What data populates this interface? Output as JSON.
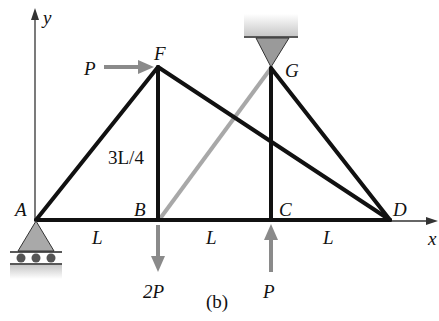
{
  "figure": {
    "caption": "(b)",
    "axes": {
      "x_label": "x",
      "y_label": "y"
    },
    "joints": {
      "A": {
        "label": "A"
      },
      "B": {
        "label": "B"
      },
      "C": {
        "label": "C"
      },
      "D": {
        "label": "D"
      },
      "F": {
        "label": "F"
      },
      "G": {
        "label": "G"
      }
    },
    "dimensions": {
      "AB": "L",
      "BC": "L",
      "CD": "L",
      "height": "3L/4"
    },
    "loads": {
      "F_horizontal": {
        "label": "P",
        "direction": "right"
      },
      "B_vertical": {
        "label": "2P",
        "direction": "down"
      },
      "C_vertical": {
        "label": "P",
        "direction": "up"
      }
    },
    "supports": {
      "A": "roller",
      "G": "pin (hanging from ceiling)"
    },
    "members": [
      {
        "from": "A",
        "to": "B",
        "style": "black"
      },
      {
        "from": "B",
        "to": "C",
        "style": "black"
      },
      {
        "from": "C",
        "to": "D",
        "style": "black"
      },
      {
        "from": "A",
        "to": "F",
        "style": "black"
      },
      {
        "from": "F",
        "to": "B",
        "style": "black"
      },
      {
        "from": "F",
        "to": "D",
        "style": "black"
      },
      {
        "from": "G",
        "to": "C",
        "style": "black"
      },
      {
        "from": "G",
        "to": "D",
        "style": "black"
      },
      {
        "from": "B",
        "to": "G",
        "style": "gray"
      }
    ],
    "colors": {
      "member": "#111111",
      "gray_member": "#a8a8a8",
      "load_arrow": "#8a8a8a",
      "support_fill": "#a9a9a9"
    }
  }
}
